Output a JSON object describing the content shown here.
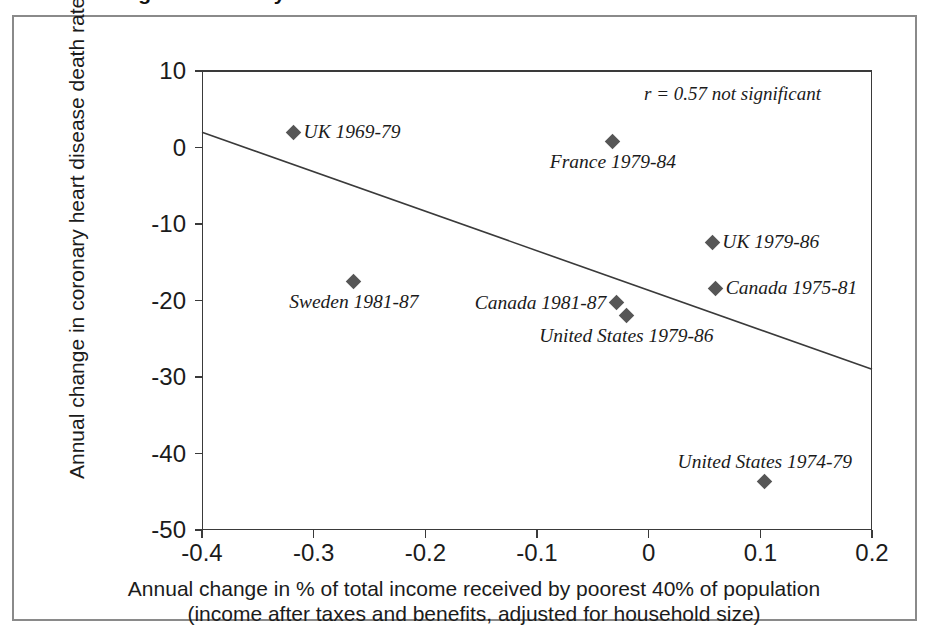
{
  "figure": {
    "title_sliver": "Annual change in coronary heart disease",
    "frame_color": "#8a8a8a",
    "axis_color": "#3a3a3a",
    "marker_color": "#565656"
  },
  "chart_data": {
    "type": "scatter",
    "title": "",
    "xlabel_line1": "Annual change in % of total income received by poorest 40% of population",
    "xlabel_line2": "(income after taxes and benefits, adjusted for household size)",
    "ylabel": "Annual change in coronary heart disease death rate",
    "xlim": [
      -0.4,
      0.2
    ],
    "ylim": [
      -50,
      10
    ],
    "xticks": [
      -0.4,
      -0.3,
      -0.2,
      -0.1,
      0,
      0.1,
      0.2
    ],
    "xtick_labels": [
      "-0.4",
      "-0.3",
      "-0.2",
      "-0.1",
      "0",
      "0.1",
      "0.2"
    ],
    "yticks": [
      10,
      0,
      -10,
      -20,
      -30,
      -40,
      -50
    ],
    "ytick_labels": [
      "10",
      "0",
      "-10",
      "-20",
      "-30",
      "-40",
      "-50"
    ],
    "grid": false,
    "legend": "none",
    "annotation": "r = 0.57 not significant",
    "trendline": {
      "x": [
        -0.4,
        0.2
      ],
      "y": [
        2.0,
        -29.0
      ]
    },
    "points": [
      {
        "label": "UK 1969-79",
        "x": -0.318,
        "y": 2.0,
        "label_pos": "right"
      },
      {
        "label": "France 1979-84",
        "x": -0.032,
        "y": 0.8,
        "label_pos": "below"
      },
      {
        "label": "UK 1979-86",
        "x": 0.057,
        "y": -12.4,
        "label_pos": "right"
      },
      {
        "label": "Sweden 1981-87",
        "x": -0.264,
        "y": -17.5,
        "label_pos": "below"
      },
      {
        "label": "Canada 1975-81",
        "x": 0.06,
        "y": -18.4,
        "label_pos": "right"
      },
      {
        "label": "Canada 1981-87",
        "x": -0.029,
        "y": -20.3,
        "label_pos": "left"
      },
      {
        "label": "United States 1979-86",
        "x": -0.02,
        "y": -21.9,
        "label_pos": "below"
      },
      {
        "label": "United States 1974-79",
        "x": 0.104,
        "y": -43.6,
        "label_pos": "above"
      }
    ]
  }
}
